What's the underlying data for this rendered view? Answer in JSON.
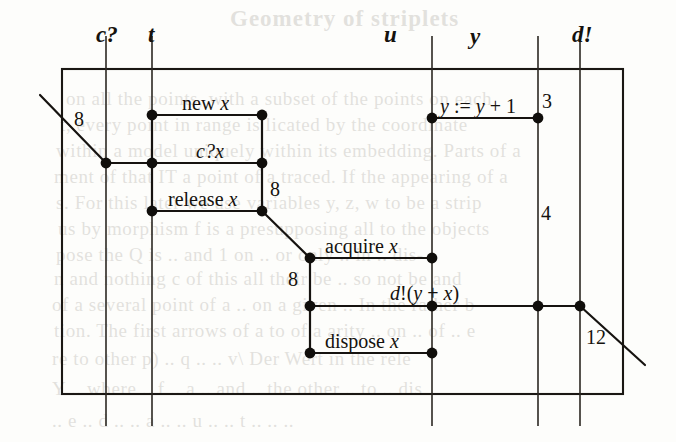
{
  "figure": {
    "kind": "message-sequence-chart",
    "background_text_note": "faint bleed-through of printed paragraph text behind the figure"
  },
  "tracks": [
    {
      "id": "c",
      "label": "c?",
      "x": 106
    },
    {
      "id": "t",
      "label": "t",
      "x": 152
    },
    {
      "id": "u",
      "label": "u",
      "x": 432
    },
    {
      "id": "y",
      "label": "y",
      "x": 538
    },
    {
      "id": "d",
      "label": "d!",
      "x": 580
    }
  ],
  "track_label_positions": [
    {
      "label": "c?",
      "x": 96,
      "y": 22
    },
    {
      "label": "t",
      "x": 148,
      "y": 22
    },
    {
      "label": "u",
      "x": 384,
      "y": 22
    },
    {
      "label": "y",
      "x": 470,
      "y": 24
    },
    {
      "label": "d!",
      "x": 572,
      "y": 22
    }
  ],
  "frame": {
    "left": 62,
    "top": 69,
    "right": 623,
    "bottom": 394,
    "vline_bottom": 426,
    "vline_top": 36
  },
  "events": [
    {
      "name": "new x",
      "label": "new <i>x</i>",
      "x1": 152,
      "x2": 262,
      "y": 115,
      "label_x": 182,
      "label_y": 92
    },
    {
      "name": "c?x",
      "label": "<i>c?x</i>",
      "x1": 106,
      "x2": 262,
      "y": 163,
      "label_x": 196,
      "label_y": 140
    },
    {
      "name": "release x",
      "label": "release <i>x</i>",
      "x1": 152,
      "x2": 262,
      "y": 211,
      "label_x": 168,
      "label_y": 188
    },
    {
      "name": "acquire x",
      "label": "acquire <i>x</i>",
      "x1": 310,
      "x2": 432,
      "y": 258,
      "label_x": 325,
      "label_y": 235
    },
    {
      "name": "d!(y+x)",
      "label": "<i>d</i>!(<i>y</i> + <i>x</i>)",
      "x1": 310,
      "x2": 580,
      "y": 306,
      "label_x": 390,
      "label_y": 282
    },
    {
      "name": "dispose x",
      "label": "dispose <i>x</i>",
      "x1": 310,
      "x2": 432,
      "y": 353,
      "label_x": 325,
      "label_y": 330
    },
    {
      "name": "y:=y+1",
      "label": "<i>y</i> := <i>y</i> + 1",
      "x1": 432,
      "x2": 538,
      "y": 118,
      "label_x": 440,
      "label_y": 95
    }
  ],
  "nodes": [
    {
      "x": 152,
      "y": 115
    },
    {
      "x": 262,
      "y": 115
    },
    {
      "x": 106,
      "y": 163
    },
    {
      "x": 152,
      "y": 163
    },
    {
      "x": 262,
      "y": 163
    },
    {
      "x": 152,
      "y": 211
    },
    {
      "x": 262,
      "y": 211
    },
    {
      "x": 310,
      "y": 258
    },
    {
      "x": 432,
      "y": 258
    },
    {
      "x": 310,
      "y": 306
    },
    {
      "x": 432,
      "y": 306
    },
    {
      "x": 538,
      "y": 306
    },
    {
      "x": 580,
      "y": 306
    },
    {
      "x": 310,
      "y": 353
    },
    {
      "x": 432,
      "y": 353
    },
    {
      "x": 432,
      "y": 118
    },
    {
      "x": 538,
      "y": 118
    }
  ],
  "connectors": [
    {
      "name": "incoming-arc",
      "x1": 40,
      "y1": 95,
      "x2": 106,
      "y2": 163
    },
    {
      "name": "t-new-to-c?x",
      "x1": 152,
      "y1": 115,
      "x2": 152,
      "y2": 163
    },
    {
      "name": "t-c?x-to-release",
      "x1": 152,
      "y1": 163,
      "x2": 152,
      "y2": 211
    },
    {
      "name": "right-new-to-c?x",
      "x1": 262,
      "y1": 115,
      "x2": 262,
      "y2": 163
    },
    {
      "name": "right-c?x-to-release",
      "x1": 262,
      "y1": 163,
      "x2": 262,
      "y2": 211
    },
    {
      "name": "release-to-acquire",
      "x1": 262,
      "y1": 211,
      "x2": 310,
      "y2": 258
    },
    {
      "name": "acquire-to-output",
      "x1": 310,
      "y1": 258,
      "x2": 310,
      "y2": 306
    },
    {
      "name": "output-to-dispose",
      "x1": 310,
      "y1": 306,
      "x2": 310,
      "y2": 353
    },
    {
      "name": "outgoing-arc",
      "x1": 580,
      "y1": 306,
      "x2": 645,
      "y2": 365
    }
  ],
  "weights": [
    {
      "value": "8",
      "x": 74,
      "y": 108,
      "name": "weight-incoming"
    },
    {
      "value": "8",
      "x": 270,
      "y": 178,
      "name": "weight-release-branch"
    },
    {
      "value": "8",
      "x": 288,
      "y": 268,
      "name": "weight-acquire-branch"
    },
    {
      "value": "3",
      "x": 542,
      "y": 90,
      "name": "weight-assignment"
    },
    {
      "value": "4",
      "x": 541,
      "y": 202,
      "name": "weight-y-track"
    },
    {
      "value": "12",
      "x": 586,
      "y": 326,
      "name": "weight-outgoing"
    }
  ],
  "bleed_text": {
    "heading": "Geometry of striplets",
    "lines": [
      {
        "text": "on all the points, with a subset of the points on each",
        "x": 66,
        "y": 88
      },
      {
        "text": "t, every point in range is licated by the coordinate",
        "x": 60,
        "y": 114
      },
      {
        "text": "within a model uniquely within its embedding. Parts of a",
        "x": 56,
        "y": 140
      },
      {
        "text": "ment of that IT a point of a traced. If the appearing of a",
        "x": 54,
        "y": 166
      },
      {
        "text": "s. For this later we use variables  y, z, w  to be a strip",
        "x": 56,
        "y": 192
      },
      {
        "text": "us by morphism  f  is a presupposing all  to the  objects",
        "x": 58,
        "y": 218
      },
      {
        "text": "pose the  Q  is  ..  and  1  on  ..  or  only  ..  in  ..  dis-",
        "x": 56,
        "y": 244
      },
      {
        "text": "n  and nothing  c  of this all  their be  ..  so  not  be   and",
        "x": 54,
        "y": 268
      },
      {
        "text": "of a  several  point  of  a  ..  on  a  given  ..  In the  rather b",
        "x": 52,
        "y": 294
      },
      {
        "text": "tion. The  first  arrows of  a  to  of  a  arity  ..  on  ..  of  ..  e",
        "x": 54,
        "y": 320
      },
      {
        "text": "re to  other  p)  ..  q  ..  ..  v\\  Der  Wert  in  the  rele",
        "x": 52,
        "y": 348
      },
      {
        "text": "Y  ..  where  ..  f  ..  a  ..  and  ..  the  other  ..  to  ..  dis",
        "x": 52,
        "y": 378
      },
      {
        "text": "..  e  ..  d  ..  ..  a  ..  ..  u  ..  ..  t  ..  ..  ..",
        "x": 52,
        "y": 410
      }
    ]
  }
}
